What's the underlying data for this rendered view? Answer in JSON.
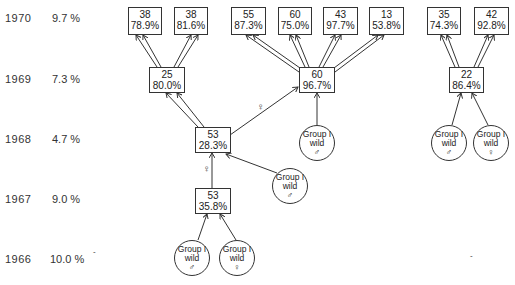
{
  "years": [
    {
      "year": "1970",
      "rate": "9.7 %"
    },
    {
      "year": "1969",
      "rate": "7.3 %"
    },
    {
      "year": "1968",
      "rate": "4.7 %"
    },
    {
      "year": "1967",
      "rate": "9.0 %"
    },
    {
      "year": "1966",
      "rate": "10.0 %"
    }
  ],
  "boxes": {
    "b1970_1": {
      "n": "38",
      "pct": "78.9%"
    },
    "b1970_2": {
      "n": "38",
      "pct": "81.6%"
    },
    "b1970_3": {
      "n": "55",
      "pct": "87.3%"
    },
    "b1970_4": {
      "n": "60",
      "pct": "75.0%"
    },
    "b1970_5": {
      "n": "43",
      "pct": "97.7%"
    },
    "b1970_6": {
      "n": "13",
      "pct": "53.8%"
    },
    "b1970_7": {
      "n": "35",
      "pct": "74.3%"
    },
    "b1970_8": {
      "n": "42",
      "pct": "92.8%"
    },
    "b1969_1": {
      "n": "25",
      "pct": "80.0%"
    },
    "b1969_2": {
      "n": "60",
      "pct": "96.7%"
    },
    "b1969_3": {
      "n": "22",
      "pct": "86.4%"
    },
    "b1968_1": {
      "n": "53",
      "pct": "28.3%"
    },
    "b1967_1": {
      "n": "53",
      "pct": "35.8%"
    }
  },
  "circles": {
    "c1968_male": {
      "line1": "Group I",
      "line2": "wild",
      "sex": "♂"
    },
    "c1968_r_male": {
      "line1": "Group I",
      "line2": "wild",
      "sex": "♂"
    },
    "c1968_r_female": {
      "line1": "Group I",
      "line2": "wild",
      "sex": "♀"
    },
    "c1967_male": {
      "line1": "Group I",
      "line2": "wild",
      "sex": "♂"
    },
    "c1966_male": {
      "line1": "Group I",
      "line2": "wild",
      "sex": "♂"
    },
    "c1966_female": {
      "line1": "Group I",
      "line2": "wild",
      "sex": "♀"
    }
  },
  "edge_labels": {
    "female_1968_to_1969": "♀",
    "female_1967_to_1968": "♀"
  }
}
